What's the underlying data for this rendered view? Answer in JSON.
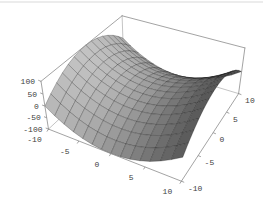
{
  "chart_data": {
    "type": "surface",
    "surface_equation": "z = x^2 - y^2",
    "z_expression": "x*x - y*y",
    "grid_points": 15,
    "x_axis": {
      "min": -10,
      "max": 10,
      "ticks": [
        -10,
        -5,
        0,
        5,
        10
      ],
      "tick_labels": [
        "-10",
        "-5",
        "0",
        "5",
        "10"
      ]
    },
    "y_axis": {
      "min": -10,
      "max": 10,
      "ticks": [
        -10,
        -5,
        0,
        5,
        10
      ],
      "tick_labels": [
        "-10",
        "-5",
        "0",
        "5",
        "10"
      ]
    },
    "z_axis": {
      "min": -100,
      "max": 100,
      "ticks": [
        100,
        50,
        0,
        -50,
        -100
      ],
      "tick_labels": [
        "100",
        "50",
        "0",
        "-50",
        "-100"
      ]
    },
    "view": {
      "projection": "perspective",
      "viewpoint": [
        1.3,
        -2.4,
        2.0
      ],
      "box_ratios": [
        1,
        1,
        0.4
      ],
      "boxed": true,
      "grid": false,
      "legend": "none",
      "title": ""
    },
    "style": {
      "background": "#ffffff",
      "top_border": "#d9d9d9",
      "box_line": "#8c8c8c",
      "hidden_box_line": "#b5b5b5",
      "mesh_line": "rgba(0,0,0,0.5)",
      "label_color": "#3d3d3d",
      "light_dir": [
        1,
        -0.15,
        0.9
      ],
      "ambient": 0.3,
      "diffuse": 0.47
    }
  }
}
